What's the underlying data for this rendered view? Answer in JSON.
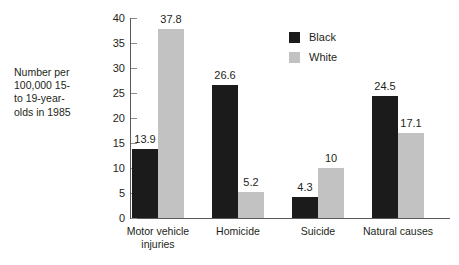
{
  "chart_data": {
    "type": "bar",
    "title": "",
    "subtitle": "",
    "xlabel": "",
    "ylabel": "Number per\n100,000 15-\nto 19-year-\nolds in 1985",
    "categories": [
      "Motor vehicle\ninjuries",
      "Homicide",
      "Suicide",
      "Natural causes"
    ],
    "series": [
      {
        "name": "Black",
        "color": "#1b1b1b",
        "values": [
          13.9,
          26.6,
          4.3,
          24.5
        ],
        "value_labels": [
          "13.9",
          "26.6",
          "4.3",
          "24.5"
        ]
      },
      {
        "name": "White",
        "color": "#c2c2c2",
        "values": [
          37.8,
          5.2,
          10,
          17.1
        ],
        "value_labels": [
          "37.8",
          "5.2",
          "10",
          "17.1"
        ]
      }
    ],
    "ylim": [
      0,
      40
    ],
    "yticks": [
      0,
      5,
      10,
      15,
      20,
      25,
      30,
      35,
      40
    ],
    "ytick_labels": [
      "0",
      "5",
      "10",
      "15",
      "20",
      "25",
      "30",
      "35",
      "40"
    ],
    "grid": false,
    "legend_position": "upper right"
  },
  "legend": {
    "items": [
      {
        "label": "Black",
        "swatch": "black"
      },
      {
        "label": "White",
        "swatch": "white"
      }
    ]
  },
  "axis": {
    "caption": "Number per\n100,000 15-\nto 19-year-\nolds in 1985"
  }
}
